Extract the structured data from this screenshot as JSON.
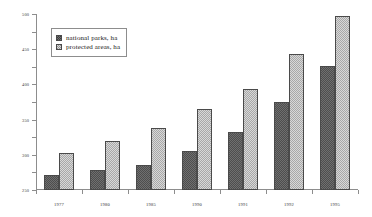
{
  "chart_data": {
    "type": "bar",
    "title": "",
    "subtitle": "",
    "xlabel": "",
    "ylabel": "",
    "categories": [
      "1977",
      "1980",
      "1985",
      "1990",
      "1991",
      "1992",
      "1995"
    ],
    "series": [
      {
        "name": "national parks, ha",
        "values": [
          43,
          57,
          70,
          112,
          165,
          251,
          353
        ],
        "color": "#6f6f6f",
        "pattern": "checkerboard-dark"
      },
      {
        "name": "protected areas, ha",
        "values": [
          104,
          140,
          176,
          229,
          286,
          385,
          493
        ],
        "color": "#d8d8d8",
        "pattern": "checkerboard-light"
      }
    ],
    "ylim": [
      0,
      500
    ],
    "yticks": [
      0,
      50,
      100,
      150,
      200,
      250,
      300,
      350,
      400,
      450,
      500
    ],
    "ytick_labels": [
      "0",
      "50",
      "100",
      "150",
      "200",
      "250",
      "300",
      "350",
      "400",
      "450",
      "500"
    ],
    "grid": false,
    "legend_position": "upper-left",
    "axis_color": "#8d8d8d"
  },
  "legend": {
    "items": [
      {
        "label": "national parks, ha"
      },
      {
        "label": "protected areas, ha"
      }
    ]
  }
}
